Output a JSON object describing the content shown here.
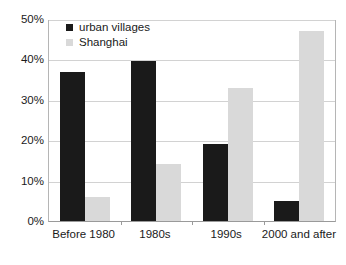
{
  "chart_data": {
    "type": "bar",
    "title": "",
    "subtitle": "",
    "xlabel": "",
    "ylabel": "",
    "categories": [
      "Before 1980",
      "1980s",
      "1990s",
      "2000 and after"
    ],
    "series": [
      {
        "name": "urban villages",
        "color": "#1a1a1a",
        "values": [
          37,
          39.5,
          19,
          5
        ]
      },
      {
        "name": "Shanghai",
        "color": "#d9d9d9",
        "values": [
          6,
          14,
          33,
          47
        ]
      }
    ],
    "ylim": [
      0,
      50
    ],
    "yticks": [
      0,
      10,
      20,
      30,
      40,
      50
    ],
    "ytick_labels": [
      "0%",
      "10%",
      "20%",
      "30%",
      "40%",
      "50%"
    ],
    "grid": true,
    "grid_axis": "y",
    "legend": {
      "position": "upper-left-inside",
      "entries": [
        {
          "label": "urban villages",
          "color": "#1a1a1a"
        },
        {
          "label": "Shanghai",
          "color": "#d9d9d9"
        }
      ]
    },
    "background": "#ffffff",
    "axis_color": "#9a9a9a",
    "gridline_color": "#d2d2d2"
  }
}
